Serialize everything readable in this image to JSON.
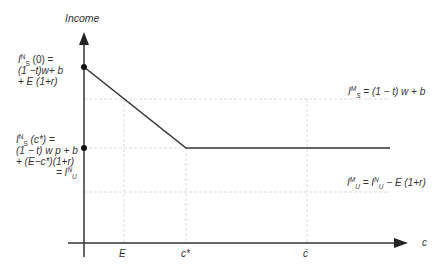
{
  "diagram": {
    "y_axis_label": "Income",
    "x_axis_label": "c",
    "x_ticks": [
      {
        "label": "E",
        "x": 124
      },
      {
        "label": "c*",
        "x": 186
      },
      {
        "label": "c̄",
        "x": 307
      }
    ],
    "left_labels": {
      "top": {
        "line1_main": "I",
        "line1_sup": "N",
        "line1_sub": "S",
        "line1_rest": " (0) =",
        "line2": "(1 −t)w+ b",
        "line3": "+ E (1+r)"
      },
      "middle": {
        "line1_main": "I",
        "line1_sup": "N",
        "line1_sub": "S",
        "line1_rest": " (c*) =",
        "line2": "(1 − t) w p + b",
        "line3": "+ (E−c*)(1+r)",
        "line4_prefix": "= I",
        "line4_sup": "N",
        "line4_sub": "U"
      }
    },
    "right_labels": {
      "upper": {
        "main": "I",
        "sup": "M",
        "sub": "S",
        "rest": " = (1 − t) w + b"
      },
      "lower": {
        "main": "I",
        "sup": "M",
        "sub": "U",
        "mid": " = I",
        "mid_sup": "N",
        "mid_sub": "U",
        "rest": " − E (1+r)"
      }
    },
    "colors": {
      "axis": "#333333",
      "line": "#333333",
      "grid": "#dddddd"
    }
  }
}
